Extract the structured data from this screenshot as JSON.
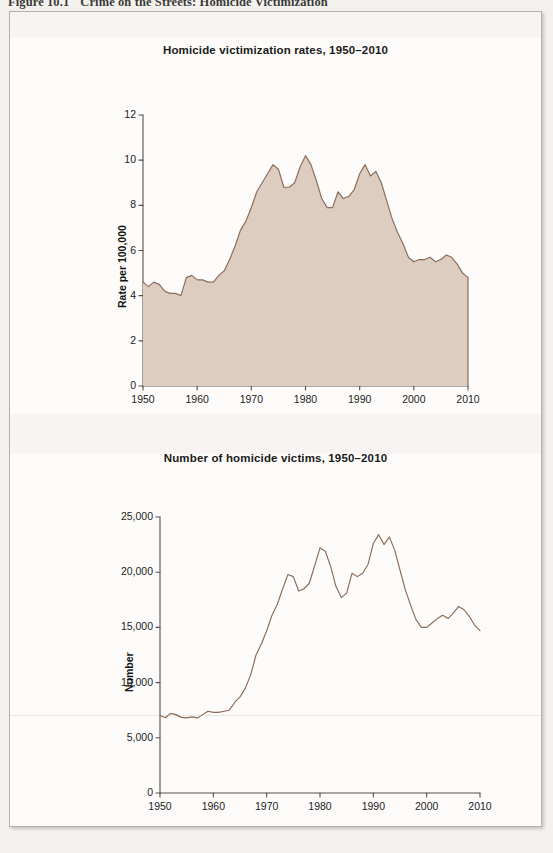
{
  "figure": {
    "caption_number": "Figure 10.1",
    "caption_text": "Crime on the Streets: Homicide Victimization"
  },
  "colors": {
    "area_fill": "#ddcdc0",
    "area_stroke": "#8d6e5c",
    "line_stroke": "#8b6a57",
    "axis": "#55504b",
    "page": "#f4f2ef",
    "panel": "#fdfcfb",
    "border": "#b9b0a6",
    "text": "#1b1a18"
  },
  "chart_data": [
    {
      "id": "rates",
      "type": "area",
      "title": "Homicide victimization rates, 1950–2010",
      "xlabel": "",
      "ylabel": "Rate per 100,000",
      "xlim": [
        1950,
        2010
      ],
      "ylim": [
        0,
        12
      ],
      "yticks": [
        0,
        2,
        4,
        6,
        8,
        10,
        12
      ],
      "ytick_labels": [
        "0",
        "2",
        "4",
        "6",
        "8",
        "10",
        "12"
      ],
      "xticks": [
        1950,
        1960,
        1970,
        1980,
        1990,
        2000,
        2010
      ],
      "xtick_labels": [
        "1950",
        "1960",
        "1970",
        "1980",
        "1990",
        "2000",
        "2010"
      ],
      "grid": false,
      "legend": "none",
      "x": [
        1950,
        1951,
        1952,
        1953,
        1954,
        1955,
        1956,
        1957,
        1958,
        1959,
        1960,
        1961,
        1962,
        1963,
        1964,
        1965,
        1966,
        1967,
        1968,
        1969,
        1970,
        1971,
        1972,
        1973,
        1974,
        1975,
        1976,
        1977,
        1978,
        1979,
        1980,
        1981,
        1982,
        1983,
        1984,
        1985,
        1986,
        1987,
        1988,
        1989,
        1990,
        1991,
        1992,
        1993,
        1994,
        1995,
        1996,
        1997,
        1998,
        1999,
        2000,
        2001,
        2002,
        2003,
        2004,
        2005,
        2006,
        2007,
        2008,
        2009,
        2010
      ],
      "values": [
        4.6,
        4.4,
        4.6,
        4.5,
        4.2,
        4.1,
        4.1,
        4.0,
        4.8,
        4.9,
        4.7,
        4.7,
        4.6,
        4.6,
        4.9,
        5.1,
        5.6,
        6.2,
        6.9,
        7.3,
        7.9,
        8.6,
        9.0,
        9.4,
        9.8,
        9.6,
        8.8,
        8.8,
        9.0,
        9.7,
        10.2,
        9.8,
        9.1,
        8.3,
        7.9,
        7.9,
        8.6,
        8.3,
        8.4,
        8.7,
        9.4,
        9.8,
        9.3,
        9.5,
        9.0,
        8.2,
        7.4,
        6.8,
        6.3,
        5.7,
        5.5,
        5.6,
        5.6,
        5.7,
        5.5,
        5.6,
        5.8,
        5.7,
        5.4,
        5.0,
        4.8
      ]
    },
    {
      "id": "number",
      "type": "line",
      "title": "Number of homicide victims, 1950–2010",
      "xlabel": "",
      "ylabel": "Number",
      "xlim": [
        1950,
        2010
      ],
      "ylim": [
        0,
        25000
      ],
      "yticks": [
        0,
        5000,
        10000,
        15000,
        20000,
        25000
      ],
      "ytick_labels": [
        "0",
        "5,000",
        "10,000",
        "15,000",
        "20,000",
        "25,000"
      ],
      "xticks": [
        1950,
        1960,
        1970,
        1980,
        1990,
        2000,
        2010
      ],
      "xtick_labels": [
        "1950",
        "1960",
        "1970",
        "1980",
        "1990",
        "2000",
        "2010"
      ],
      "grid": false,
      "legend": "none",
      "x": [
        1950,
        1951,
        1952,
        1953,
        1954,
        1955,
        1956,
        1957,
        1958,
        1959,
        1960,
        1961,
        1962,
        1963,
        1964,
        1965,
        1966,
        1967,
        1968,
        1969,
        1970,
        1971,
        1972,
        1973,
        1974,
        1975,
        1976,
        1977,
        1978,
        1979,
        1980,
        1981,
        1982,
        1983,
        1984,
        1985,
        1986,
        1987,
        1988,
        1989,
        1990,
        1991,
        1992,
        1993,
        1994,
        1995,
        1996,
        1997,
        1998,
        1999,
        2000,
        2001,
        2002,
        2003,
        2004,
        2005,
        2006,
        2007,
        2008,
        2009,
        2010
      ],
      "values": [
        7020,
        6820,
        7210,
        7100,
        6850,
        6800,
        6900,
        6800,
        7100,
        7400,
        7300,
        7300,
        7400,
        7500,
        8200,
        8700,
        9500,
        10700,
        12500,
        13500,
        14700,
        16100,
        17100,
        18500,
        19800,
        19600,
        18300,
        18500,
        19000,
        20600,
        22200,
        21900,
        20500,
        18700,
        17700,
        18100,
        19900,
        19600,
        19900,
        20700,
        22600,
        23400,
        22500,
        23200,
        22000,
        20200,
        18400,
        17000,
        15700,
        15000,
        15000,
        15400,
        15800,
        16100,
        15800,
        16300,
        16900,
        16600,
        16000,
        15200,
        14700
      ]
    }
  ]
}
